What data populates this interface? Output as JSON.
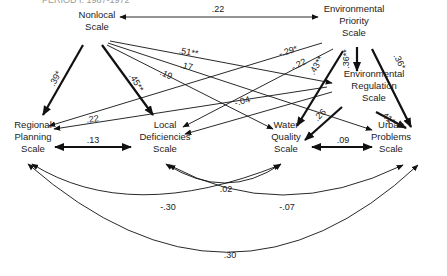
{
  "title": "PERIOD I: 1967-1972",
  "nodes": [
    {
      "id": "nonlocal",
      "lines": [
        "Nonlocal",
        "Scale"
      ]
    },
    {
      "id": "env_priority",
      "lines": [
        "Environmental",
        "Priority",
        "Scale"
      ]
    },
    {
      "id": "env_regulation",
      "lines": [
        "Environmental",
        "Regulation",
        "Scale"
      ]
    },
    {
      "id": "regional_planning",
      "lines": [
        "Regional",
        "Planning",
        "Scale"
      ]
    },
    {
      "id": "local_deficiencies",
      "lines": [
        "Local",
        "Deficiencies",
        "Scale"
      ]
    },
    {
      "id": "water_quality",
      "lines": [
        "Water",
        "Quality",
        "Scale"
      ]
    },
    {
      "id": "urban_problems",
      "lines": [
        "Urban",
        "Problems",
        "Scale"
      ]
    }
  ],
  "edges": [
    {
      "from": "nonlocal",
      "to": "env_priority",
      "label": ".22",
      "type": "double",
      "weight": "thin"
    },
    {
      "from": "nonlocal",
      "to": "regional_planning",
      "label": ".39*",
      "type": "single",
      "weight": "thick"
    },
    {
      "from": "nonlocal",
      "to": "local_deficiencies",
      "label": ".45**",
      "type": "single",
      "weight": "thick"
    },
    {
      "from": "nonlocal",
      "to": "env_regulation",
      "label": ".51**",
      "type": "single",
      "weight": "thin"
    },
    {
      "from": "nonlocal",
      "to": "urban_problems",
      "label": ".17",
      "type": "single",
      "weight": "thin"
    },
    {
      "from": "nonlocal",
      "to": "water_quality",
      "label": ".19",
      "type": "single",
      "weight": "thin"
    },
    {
      "from": "env_priority",
      "to": "regional_planning",
      "label": "-.29*",
      "type": "single",
      "weight": "thin"
    },
    {
      "from": "env_priority",
      "to": "local_deficiencies",
      "label": "-.22",
      "type": "single",
      "weight": "thin"
    },
    {
      "from": "env_priority",
      "to": "env_regulation",
      "label": ".36**",
      "type": "single",
      "weight": "thick"
    },
    {
      "from": "env_priority",
      "to": "water_quality",
      "label": ".43**",
      "type": "single",
      "weight": "thick"
    },
    {
      "from": "env_priority",
      "to": "urban_problems",
      "label": ".36*",
      "type": "single",
      "weight": "thick"
    },
    {
      "from": "env_regulation",
      "to": "regional_planning",
      "label": ".22",
      "type": "single",
      "weight": "thin"
    },
    {
      "from": "env_regulation",
      "to": "local_deficiencies",
      "label": "-.04",
      "type": "single",
      "weight": "thin"
    },
    {
      "from": "env_regulation",
      "to": "water_quality",
      "label": ".26",
      "type": "single",
      "weight": "thick"
    },
    {
      "from": "env_regulation",
      "to": "urban_problems",
      "label": ".41*",
      "type": "single",
      "weight": "thick"
    },
    {
      "from": "regional_planning",
      "to": "local_deficiencies",
      "label": ".13",
      "type": "double",
      "weight": "thick"
    },
    {
      "from": "water_quality",
      "to": "urban_problems",
      "label": ".09",
      "type": "double",
      "weight": "thick"
    },
    {
      "from": "local_deficiencies",
      "to": "water_quality",
      "label": ".02",
      "type": "curved-double",
      "weight": "thin"
    },
    {
      "from": "regional_planning",
      "to": "water_quality",
      "label": "-.30",
      "type": "curved-double",
      "weight": "thin"
    },
    {
      "from": "local_deficiencies",
      "to": "urban_problems",
      "label": "-.07",
      "type": "curved-double",
      "weight": "thin"
    },
    {
      "from": "regional_planning",
      "to": "urban_problems",
      "label": ".30",
      "type": "curved-double",
      "weight": "thin"
    }
  ]
}
